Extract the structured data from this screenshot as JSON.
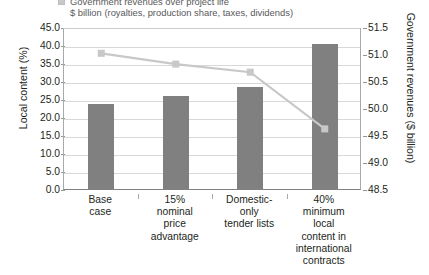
{
  "legend": {
    "items": [
      {
        "marker": "line-square-marker",
        "label": "Government revenues over project life",
        "sublabel": "$ billion (royalties, production share, taxes, dividends)",
        "color": "#c8c8c8"
      }
    ]
  },
  "axes": {
    "left": {
      "title": "Local content (%)",
      "ticks": [
        "45.0",
        "40.0",
        "35.0",
        "30.0",
        "25.0",
        "20.0",
        "15.0",
        "10.0",
        "5.0",
        "0.0"
      ],
      "min": 0.0,
      "max": 45.0,
      "step": 5.0
    },
    "right": {
      "title": "Government revenues ($ billion)",
      "ticks": [
        "51.5",
        "51.0",
        "50.5",
        "50.0",
        "49.5",
        "49.0",
        "48.5"
      ],
      "min": 48.5,
      "max": 51.5,
      "step": 0.5
    }
  },
  "categories": [
    "Base\ncase",
    "15%\nnominal\nprice\nadvantage",
    "Domestic-\nonly\ntender lists",
    "40%\nminimum\nlocal\ncontent in\ninternational\ncontracts"
  ],
  "colors": {
    "bar": "#808080",
    "line": "#c8c8c8",
    "grid": "#d6d8da",
    "axis": "#a7a9ac",
    "text": "#231f20"
  },
  "chart_data": {
    "type": "bar",
    "title": "",
    "xlabel": "",
    "ylabel": "Local content (%)",
    "y2label": "Government revenues ($ billion)",
    "ylim": [
      0.0,
      45.0
    ],
    "y2lim": [
      48.5,
      51.5
    ],
    "grid": true,
    "legend_position": "top",
    "categories": [
      "Base case",
      "15% nominal price advantage",
      "Domestic-only tender lists",
      "40% minimum local content in international contracts"
    ],
    "series": [
      {
        "name": "Local content",
        "type": "bar",
        "axis": "left",
        "unit": "%",
        "color": "#808080",
        "values": [
          23.6,
          25.8,
          28.3,
          40.3
        ]
      },
      {
        "name": "Government revenues over project life",
        "type": "line",
        "axis": "right",
        "unit": "$ billion",
        "color": "#c8c8c8",
        "marker": "square",
        "values": [
          51.05,
          50.85,
          50.7,
          49.65
        ]
      }
    ]
  }
}
